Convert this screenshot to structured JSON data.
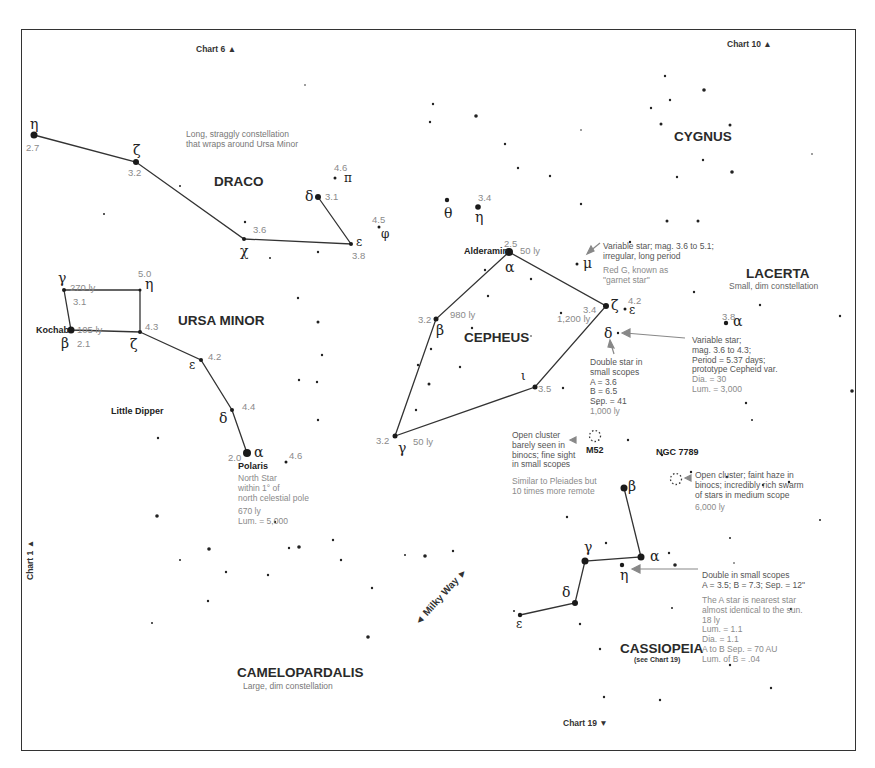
{
  "chart_refs": {
    "top_left": "Chart 6 ▲",
    "top_right": "Chart 10 ▲",
    "left": "Chart 1 ▲",
    "bottom": "Chart 19 ▼"
  },
  "milky_way": "◄ Milky Way ►",
  "constellations": {
    "draco": {
      "name": "DRACO",
      "note": "Long, straggly constellation\nthat wraps around Ursa Minor",
      "stars": [
        {
          "greek": "η",
          "mag": "2.7"
        },
        {
          "greek": "ζ",
          "mag": "3.2"
        },
        {
          "greek": "χ",
          "mag": "3.6"
        },
        {
          "greek": "ε",
          "mag": "3.8"
        },
        {
          "greek": "δ",
          "mag": "3.1"
        },
        {
          "greek": "π",
          "mag": "4.6"
        },
        {
          "greek": "φ",
          "mag": "4.5"
        },
        {
          "greek": "θ",
          "mag": ""
        },
        {
          "greek": "η",
          "mag": "3.4"
        }
      ]
    },
    "cygnus": {
      "name": "CYGNUS"
    },
    "ursa_minor": {
      "name": "URSA MINOR",
      "alt_name": "Little Dipper",
      "stars": [
        {
          "greek": "γ",
          "mag": "3.1",
          "dist": "270 ly"
        },
        {
          "greek": "η",
          "mag": "5.0"
        },
        {
          "greek": "β",
          "mag": "2.1",
          "dist": "105 ly",
          "name": "Kochab"
        },
        {
          "greek": "ζ",
          "mag": "4.3"
        },
        {
          "greek": "ε",
          "mag": "4.2"
        },
        {
          "greek": "δ",
          "mag": "4.4"
        },
        {
          "greek": "α",
          "mag": "2.0",
          "name": "Polaris"
        }
      ],
      "polaris_note": "North Star\nwithin 1° of\nnorth celestial pole",
      "polaris_dist": "670 ly\nLum. = 5,000",
      "nearby_mag": "4.6"
    },
    "cepheus": {
      "name": "CEPHEUS",
      "stars": [
        {
          "greek": "α",
          "mag": "2.5",
          "dist": "50 ly",
          "name": "Alderamin"
        },
        {
          "greek": "β",
          "mag": "3.2",
          "dist": "980 ly"
        },
        {
          "greek": "γ",
          "mag": "3.2",
          "dist": "50 ly"
        },
        {
          "greek": "ι",
          "mag": "3.5"
        },
        {
          "greek": "ζ",
          "mag": "3.4",
          "dist": "1,200 ly"
        },
        {
          "greek": "ε",
          "mag": "4.2"
        },
        {
          "greek": "δ",
          "mag": ""
        },
        {
          "greek": "μ",
          "mag": ""
        }
      ],
      "mu_note": "Variable star; mag. 3.6 to 5.1;\nirregular, long period",
      "mu_note2": "Red G, known as\n\"garnet star\"",
      "delta_note": "Variable star;\nmag. 3.6 to 4.3;\nPeriod = 5.37 days;\nprototype Cepheid var.",
      "delta_note2": "Dia. = 30\nLum. = 3,000",
      "delta_double": "Double star in\nsmall scopes\nA = 3.6\nB = 6.5\nSep. = 41",
      "delta_double2": "1,000 ly"
    },
    "lacerta": {
      "name": "LACERTA",
      "note": "Small, dim constellation",
      "stars": [
        {
          "greek": "α",
          "mag": "3.8"
        }
      ]
    },
    "cassiopeia": {
      "name": "CASSIOPEIA",
      "see": "(see Chart 19)",
      "stars": [
        {
          "greek": "β",
          "mag": ""
        },
        {
          "greek": "α",
          "mag": ""
        },
        {
          "greek": "γ",
          "mag": ""
        },
        {
          "greek": "η",
          "mag": ""
        },
        {
          "greek": "δ",
          "mag": ""
        },
        {
          "greek": "ε",
          "mag": ""
        }
      ],
      "eta_note": "Double in small scopes\nA = 3.5; B = 7.3; Sep. = 12\"",
      "eta_note2": "The A star is nearest star\nalmost identical to the sun.\n18 ly\nLum. = 1.1\nDia. = 1.1\nA to B Sep. = 70 AU\nLum. of B = .04"
    },
    "camelopardalis": {
      "name": "CAMELOPARDALIS",
      "note": "Large, dim constellation"
    }
  },
  "clusters": {
    "m52": {
      "name": "M52",
      "note": "Open cluster\nbarely seen in\nbinocs; fine sight\nin small scopes",
      "note2": "Similar to Pleiades but\n10 times more remote"
    },
    "ngc7789": {
      "name": "NGC 7789",
      "note": "Open cluster; faint haze in\nbinocs; incredibly rich swarm\nof stars in medium scope",
      "note2": "6,000 ly"
    }
  },
  "colors": {
    "line": "#333333",
    "star": "#1a1a1a",
    "faint_text": "#8a8a8a",
    "arrow": "#888888"
  }
}
